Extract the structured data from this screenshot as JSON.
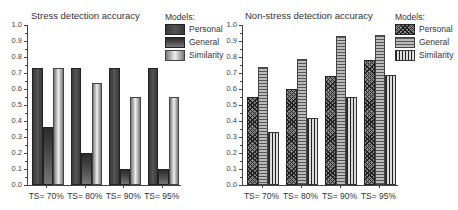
{
  "chart_data": [
    {
      "type": "bar",
      "title": "Stress detection accuracy",
      "categories": [
        "TS= 70%",
        "TS= 80%",
        "TS= 90%",
        "TS= 95%"
      ],
      "series": [
        {
          "name": "Personal",
          "values": [
            0.73,
            0.73,
            0.73,
            0.73
          ]
        },
        {
          "name": "General",
          "values": [
            0.36,
            0.2,
            0.1,
            0.1
          ]
        },
        {
          "name": "Similarity",
          "values": [
            0.73,
            0.64,
            0.55,
            0.55
          ]
        }
      ],
      "xlabel": "",
      "ylabel": "",
      "ylim": [
        0,
        1.0
      ],
      "yticks": [
        "0.0",
        "0.1",
        "0.2",
        "0.3",
        "0.4",
        "0.5",
        "0.6",
        "0.7",
        "0.8",
        "0.9",
        "1.0"
      ],
      "legend": {
        "title": "Models:",
        "position": "right",
        "entries": [
          "Personal",
          "General",
          "Similarity"
        ]
      },
      "grid": false
    },
    {
      "type": "bar",
      "title": "Non-stress detection accuracy",
      "categories": [
        "TS= 70%",
        "TS= 80%",
        "TS= 90%",
        "TS= 95%"
      ],
      "series": [
        {
          "name": "Personal",
          "values": [
            0.55,
            0.6,
            0.68,
            0.78
          ]
        },
        {
          "name": "General",
          "values": [
            0.74,
            0.79,
            0.93,
            0.94
          ]
        },
        {
          "name": "Similarity",
          "values": [
            0.33,
            0.42,
            0.55,
            0.69
          ]
        }
      ],
      "xlabel": "",
      "ylabel": "",
      "ylim": [
        0,
        1.0
      ],
      "yticks": [
        "0.0",
        "0.1",
        "0.2",
        "0.3",
        "0.4",
        "0.5",
        "0.6",
        "0.7",
        "0.8",
        "0.9",
        "1.0"
      ],
      "legend": {
        "title": "Models:",
        "position": "right",
        "entries": [
          "Personal",
          "General",
          "Similarity"
        ]
      },
      "grid": false
    }
  ]
}
